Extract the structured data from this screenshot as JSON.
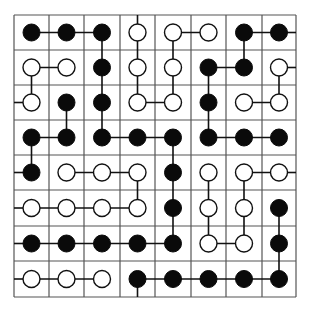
{
  "puzzle": {
    "title": "Pearl puzzle grid",
    "rows": 8,
    "cols": 8,
    "colors": {
      "grid": "#555555",
      "line": "#111111",
      "black_pearl": "#0a0a0a",
      "white_pearl": "#ffffff"
    },
    "grid_x": [
      14,
      49,
      84,
      120,
      155,
      191,
      226,
      262,
      296
    ],
    "grid_y": [
      15,
      50,
      85,
      120,
      155,
      190,
      226,
      261,
      297
    ],
    "pearls": [
      [
        "B",
        "B",
        "B",
        "W",
        "W",
        "W",
        "B",
        "B"
      ],
      [
        "W",
        "W",
        "B",
        "W",
        "W",
        "B",
        "B",
        "W"
      ],
      [
        "W",
        "B",
        "B",
        "W",
        "W",
        "B",
        "W",
        "W"
      ],
      [
        "B",
        "B",
        "B",
        "B",
        "B",
        "B",
        "B",
        "B"
      ],
      [
        "B",
        "W",
        "W",
        "W",
        "B",
        "W",
        "W",
        "W"
      ],
      [
        "W",
        "W",
        "W",
        "W",
        "B",
        "W",
        "W",
        "B"
      ],
      [
        "B",
        "B",
        "B",
        "B",
        "B",
        "W",
        "W",
        "B"
      ],
      [
        "W",
        "W",
        "W",
        "B",
        "B",
        "B",
        "B",
        "B"
      ]
    ],
    "segments": [
      [
        [
          0,
          0
        ],
        [
          0,
          1
        ]
      ],
      [
        [
          0,
          1
        ],
        [
          0,
          2
        ]
      ],
      [
        [
          0,
          2
        ],
        [
          1,
          2
        ]
      ],
      [
        [
          0,
          3
        ],
        "up"
      ],
      [
        [
          0,
          3
        ],
        [
          1,
          3
        ]
      ],
      [
        [
          0,
          4
        ],
        [
          0,
          5
        ]
      ],
      [
        [
          0,
          4
        ],
        [
          1,
          4
        ]
      ],
      [
        [
          0,
          6
        ],
        [
          0,
          7
        ]
      ],
      [
        [
          0,
          6
        ],
        [
          1,
          6
        ]
      ],
      [
        [
          0,
          7
        ],
        "right"
      ],
      [
        [
          1,
          0
        ],
        [
          1,
          1
        ]
      ],
      [
        [
          1,
          0
        ],
        [
          2,
          0
        ]
      ],
      [
        [
          1,
          2
        ],
        [
          2,
          2
        ]
      ],
      [
        [
          1,
          3
        ],
        [
          2,
          3
        ]
      ],
      [
        [
          1,
          4
        ],
        [
          2,
          4
        ]
      ],
      [
        [
          1,
          5
        ],
        [
          1,
          6
        ]
      ],
      [
        [
          1,
          5
        ],
        [
          2,
          5
        ]
      ],
      [
        [
          1,
          7
        ],
        "right"
      ],
      [
        [
          1,
          7
        ],
        [
          2,
          7
        ]
      ],
      [
        [
          2,
          0
        ],
        "left"
      ],
      [
        [
          2,
          1
        ],
        [
          3,
          1
        ]
      ],
      [
        [
          2,
          2
        ],
        [
          3,
          2
        ]
      ],
      [
        [
          2,
          3
        ],
        [
          2,
          4
        ]
      ],
      [
        [
          2,
          5
        ],
        [
          3,
          5
        ]
      ],
      [
        [
          2,
          6
        ],
        [
          2,
          7
        ]
      ],
      [
        [
          3,
          0
        ],
        [
          3,
          1
        ]
      ],
      [
        [
          3,
          0
        ],
        [
          4,
          0
        ]
      ],
      [
        [
          3,
          2
        ],
        [
          3,
          3
        ]
      ],
      [
        [
          3,
          3
        ],
        [
          3,
          4
        ]
      ],
      [
        [
          3,
          4
        ],
        [
          4,
          4
        ]
      ],
      [
        [
          3,
          5
        ],
        [
          3,
          6
        ]
      ],
      [
        [
          3,
          6
        ],
        [
          3,
          7
        ]
      ],
      [
        [
          4,
          0
        ],
        "left"
      ],
      [
        [
          4,
          1
        ],
        [
          4,
          2
        ]
      ],
      [
        [
          4,
          2
        ],
        [
          4,
          3
        ]
      ],
      [
        [
          4,
          3
        ],
        [
          5,
          3
        ]
      ],
      [
        [
          4,
          4
        ],
        [
          5,
          4
        ]
      ],
      [
        [
          4,
          5
        ],
        [
          5,
          5
        ]
      ],
      [
        [
          4,
          6
        ],
        [
          4,
          7
        ]
      ],
      [
        [
          4,
          6
        ],
        [
          5,
          6
        ]
      ],
      [
        [
          4,
          7
        ],
        "right"
      ],
      [
        [
          5,
          0
        ],
        "left"
      ],
      [
        [
          5,
          0
        ],
        [
          5,
          1
        ]
      ],
      [
        [
          5,
          1
        ],
        [
          5,
          2
        ]
      ],
      [
        [
          5,
          2
        ],
        [
          5,
          3
        ]
      ],
      [
        [
          5,
          4
        ],
        [
          6,
          4
        ]
      ],
      [
        [
          5,
          5
        ],
        [
          6,
          5
        ]
      ],
      [
        [
          5,
          6
        ],
        [
          6,
          6
        ]
      ],
      [
        [
          5,
          7
        ],
        [
          6,
          7
        ]
      ],
      [
        [
          6,
          0
        ],
        "left"
      ],
      [
        [
          6,
          0
        ],
        [
          6,
          1
        ]
      ],
      [
        [
          6,
          1
        ],
        [
          6,
          2
        ]
      ],
      [
        [
          6,
          2
        ],
        [
          6,
          3
        ]
      ],
      [
        [
          6,
          3
        ],
        [
          6,
          4
        ]
      ],
      [
        [
          6,
          5
        ],
        [
          6,
          6
        ]
      ],
      [
        [
          6,
          7
        ],
        [
          7,
          7
        ]
      ],
      [
        [
          7,
          0
        ],
        "left"
      ],
      [
        [
          7,
          0
        ],
        [
          7,
          1
        ]
      ],
      [
        [
          7,
          1
        ],
        [
          7,
          2
        ]
      ],
      [
        [
          7,
          3
        ],
        "down"
      ],
      [
        [
          7,
          3
        ],
        [
          7,
          4
        ]
      ],
      [
        [
          7,
          4
        ],
        [
          7,
          5
        ]
      ],
      [
        [
          7,
          5
        ],
        [
          7,
          6
        ]
      ],
      [
        [
          7,
          6
        ],
        [
          7,
          7
        ]
      ]
    ],
    "pearl_radius": 8.5
  }
}
